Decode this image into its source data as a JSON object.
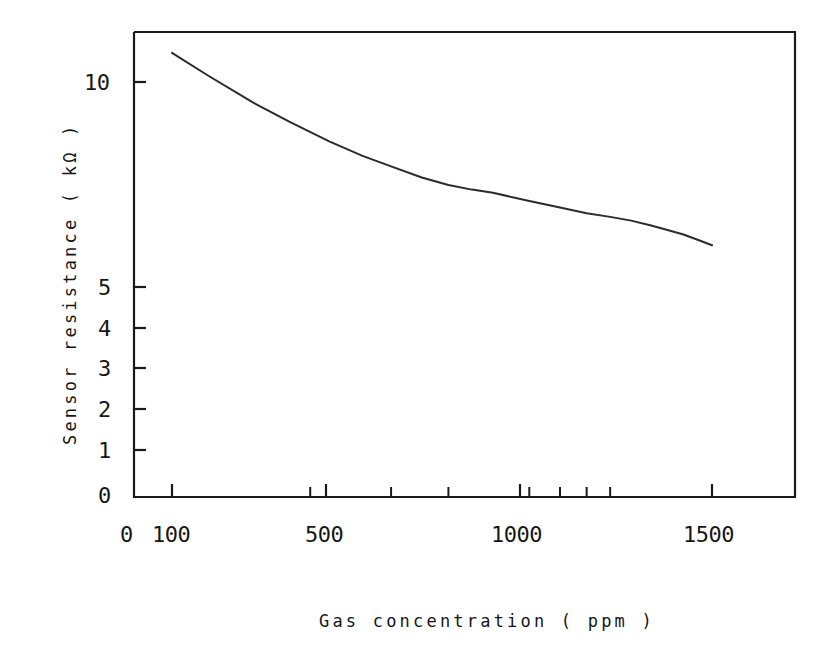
{
  "chart_data": {
    "type": "line",
    "title": "",
    "xlabel": "Gas concentration ( ppm )",
    "ylabel": "Sensor resistance ( kΩ )",
    "xscale": "log",
    "yscale": "log",
    "xlim": [
      90,
      1900
    ],
    "ylim": [
      0.9,
      13.5
    ],
    "grid": false,
    "legend": null,
    "x_tick_labels": [
      "0",
      "100",
      "500",
      "1000",
      "1500"
    ],
    "x_tick_values": [
      0,
      100,
      500,
      1000,
      1500
    ],
    "x_minor_ticks": [
      200,
      300,
      400,
      600,
      700,
      800,
      900
    ],
    "y_tick_labels": [
      "0",
      "1",
      "2",
      "3",
      "4",
      "5",
      "10"
    ],
    "y_tick_values": [
      0,
      1,
      2,
      3,
      4,
      5,
      10
    ],
    "series": [
      {
        "name": "Sensor resistance",
        "x": [
          100,
          120,
          150,
          180,
          220,
          260,
          300,
          350,
          400,
          450,
          500,
          600,
          700,
          800,
          900,
          1000,
          1100,
          1200,
          1300,
          1400,
          1500
        ],
        "y": [
          12.0,
          10.4,
          8.8,
          7.8,
          6.9,
          6.3,
          5.9,
          5.5,
          5.25,
          5.1,
          5.0,
          4.75,
          4.56,
          4.4,
          4.3,
          4.2,
          4.08,
          3.96,
          3.85,
          3.72,
          3.6
        ]
      }
    ],
    "annotations": []
  },
  "axes": {
    "x_tick_labels": [
      "0",
      "100",
      "500",
      "1000",
      "1500"
    ],
    "y_tick_labels": [
      "10",
      "5",
      "4",
      "3",
      "2",
      "1",
      "0"
    ],
    "x_axis_title": "Gas concentration ( ppm )",
    "y_axis_title": "Sensor resistance ( kΩ )"
  },
  "style": {
    "line_color": "#2b2b2b",
    "axis_color": "#1a1a1a",
    "background": "#ffffff"
  }
}
